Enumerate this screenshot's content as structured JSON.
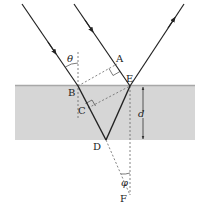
{
  "diagram": {
    "type": "thin-film-interference",
    "colors": {
      "slab": "#d6d6d6",
      "slab_edge": "#a8a8a8",
      "ray": "#222222",
      "dashed": "#666666"
    },
    "labels": {
      "A": "A",
      "B": "B",
      "C": "C",
      "D": "D",
      "E": "E",
      "F": "F",
      "theta": "θ",
      "phi": "φ",
      "d": "d"
    }
  }
}
